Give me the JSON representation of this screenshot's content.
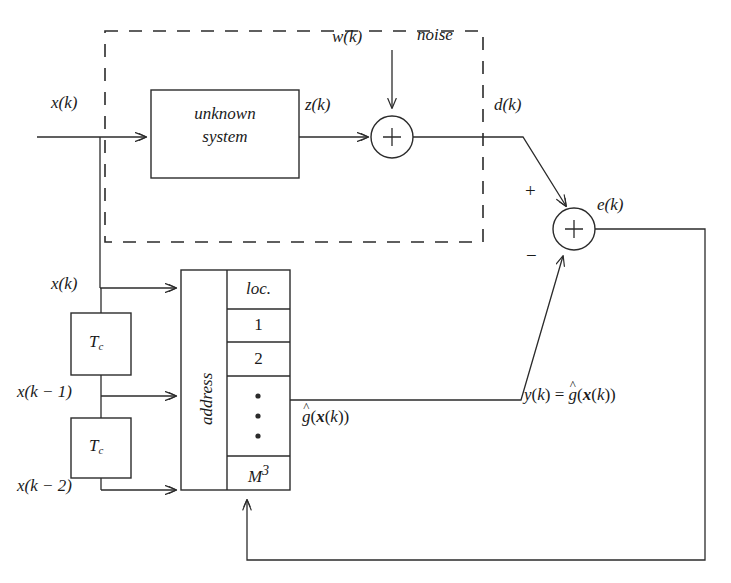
{
  "figure": {
    "type": "block-diagram",
    "stroke_color": "#2b2b2b",
    "background_color": "#ffffff"
  },
  "signals": {
    "input_top": "x(k)",
    "input_table": "x(k)",
    "delayed_1": "x(k − 1)",
    "delayed_2": "x(k − 2)",
    "system_output": "z(k)",
    "noise": "w(k)",
    "desired": "d(k)",
    "error": "e(k)",
    "table_output": "ĝ(x(k))",
    "estimate": "y(k) = ĝ(x(k))"
  },
  "blocks": {
    "unknown_system_line1": "unknown",
    "unknown_system_line2": "system",
    "delay_1": "T",
    "delay_1_sub": "c",
    "delay_2": "T",
    "delay_2_sub": "c",
    "address_label": "address",
    "noise_box_label": "noise"
  },
  "table": {
    "header": "loc.",
    "rows": [
      "1",
      "2",
      "•",
      "M"
    ],
    "last_row_exponent": "3",
    "ellipsis_dots": 3
  },
  "adders": {
    "noise_adder_symbol": "+",
    "error_adder_symbol": "+",
    "error_adder_plus": "+",
    "error_adder_minus": "−"
  },
  "math_parts": {
    "x": "x",
    "k": "k",
    "k_minus_1": "k − 1",
    "k_minus_2": "k − 2",
    "z": "z",
    "w": "w",
    "d": "d",
    "e": "e",
    "y": "y",
    "g": "g",
    "M": "M",
    "hat": "ˆ",
    "equals": "=",
    "open_paren": "(",
    "close_paren": ")"
  }
}
